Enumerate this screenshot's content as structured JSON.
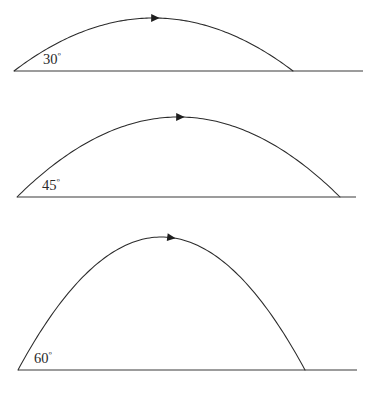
{
  "figure": {
    "background_color": "#ffffff",
    "stroke_color": "#2b2b2b",
    "ground_color": "#3a3a3a",
    "label_color": "#2a2a2a",
    "width": 372,
    "height": 406
  },
  "chart_data": {
    "type": "line",
    "subtitle": "",
    "xlabel": "",
    "ylabel": "",
    "grid": false,
    "legend": "none",
    "annotations": [
      "30º",
      "45º",
      "60º"
    ],
    "series": [
      {
        "name": "30º",
        "angle_deg": 30,
        "launch_x": 14,
        "launch_y": 71,
        "landing_x": 293,
        "landing_y": 71,
        "apex_x": 153,
        "apex_y": 18,
        "range_px": 279,
        "max_height_px": 53,
        "ground_start_x": 14,
        "ground_end_x": 363,
        "ground_y": 71,
        "arrow_x": 155,
        "arrow_y": 19,
        "label": "30º",
        "label_value": "30",
        "label_unit": "º",
        "label_x": 43,
        "label_y": 64
      },
      {
        "name": "45º",
        "angle_deg": 45,
        "launch_x": 17,
        "launch_y": 197,
        "landing_x": 340,
        "landing_y": 197,
        "apex_x": 178,
        "apex_y": 117,
        "range_px": 323,
        "max_height_px": 80,
        "ground_start_x": 17,
        "ground_end_x": 356,
        "ground_y": 197,
        "arrow_x": 180,
        "arrow_y": 118,
        "label": "45º",
        "label_value": "45",
        "label_unit": "º",
        "label_x": 42,
        "label_y": 190
      },
      {
        "name": "60º",
        "angle_deg": 60,
        "launch_x": 18,
        "launch_y": 370,
        "landing_x": 305,
        "landing_y": 370,
        "apex_x": 172,
        "apex_y": 237,
        "range_px": 287,
        "max_height_px": 133,
        "ground_start_x": 18,
        "ground_end_x": 357,
        "ground_y": 370,
        "arrow_x": 171,
        "arrow_y": 238,
        "label": "60º",
        "label_value": "60",
        "label_unit": "º",
        "label_x": 34,
        "label_y": 363
      }
    ]
  }
}
